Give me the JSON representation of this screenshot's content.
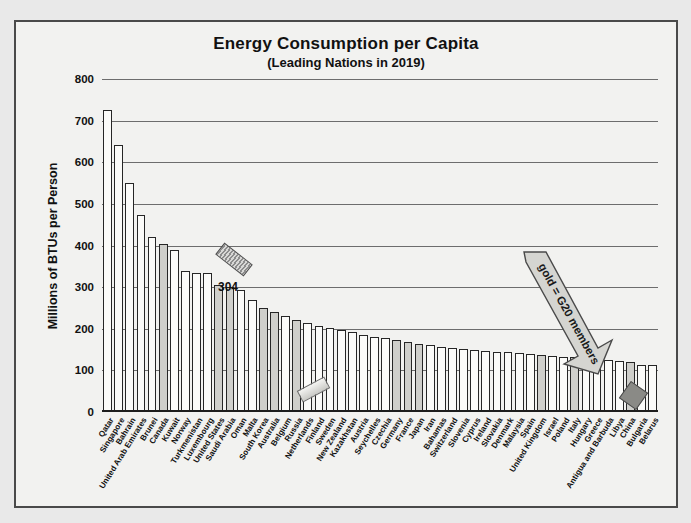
{
  "chart_data": {
    "type": "bar",
    "title": "Energy Consumption per Capita",
    "subtitle": "(Leading Nations in 2019)",
    "xlabel": "",
    "ylabel": "Millions of BTUs per Person",
    "ylim": [
      0,
      800
    ],
    "yticks": [
      0,
      100,
      200,
      300,
      400,
      500,
      600,
      700,
      800
    ],
    "grid": true,
    "legend": "none",
    "categories": [
      "Qatar",
      "Singapore",
      "Bahrain",
      "United Arab Emirates",
      "Brunei",
      "Canada",
      "Kuwait",
      "Norway",
      "Turkmenistan",
      "Luxembourg",
      "United States",
      "Saudi Arabia",
      "Oman",
      "Malta",
      "South Korea",
      "Australia",
      "Belgium",
      "Russia",
      "Netherlands",
      "Finland",
      "Sweden",
      "New Zealand",
      "Kazakhstan",
      "Austria",
      "Seychelles",
      "Czechia",
      "Germany",
      "France",
      "Japan",
      "Iran",
      "Bahamas",
      "Switzerland",
      "Slovenia",
      "Cyprus",
      "Ireland",
      "Slovakia",
      "Denmark",
      "Malaysia",
      "Spain",
      "United Kingdom",
      "Israel",
      "Poland",
      "Italy",
      "Hungary",
      "Greece",
      "Antigua and Barbuda",
      "Libya",
      "China",
      "Bulgaria",
      "Belarus"
    ],
    "values": [
      726,
      642,
      549,
      474,
      420,
      404,
      389,
      338,
      335,
      333,
      304,
      300,
      292,
      270,
      250,
      241,
      230,
      220,
      213,
      207,
      203,
      196,
      192,
      186,
      181,
      177,
      173,
      168,
      164,
      160,
      157,
      154,
      151,
      149,
      147,
      145,
      143,
      141,
      139,
      137,
      135,
      133,
      131,
      129,
      127,
      125,
      122,
      119,
      114,
      112
    ],
    "g20_members": [
      "Canada",
      "Saudi Arabia",
      "United States",
      "South Korea",
      "Australia",
      "Russia",
      "Germany",
      "France",
      "Japan",
      "United Kingdom",
      "Italy",
      "China"
    ],
    "annotations": [
      {
        "name": "value-callout",
        "text": "304",
        "target": "United States"
      },
      {
        "name": "g20-arrow-label",
        "text": "gold = G20 members"
      }
    ]
  }
}
